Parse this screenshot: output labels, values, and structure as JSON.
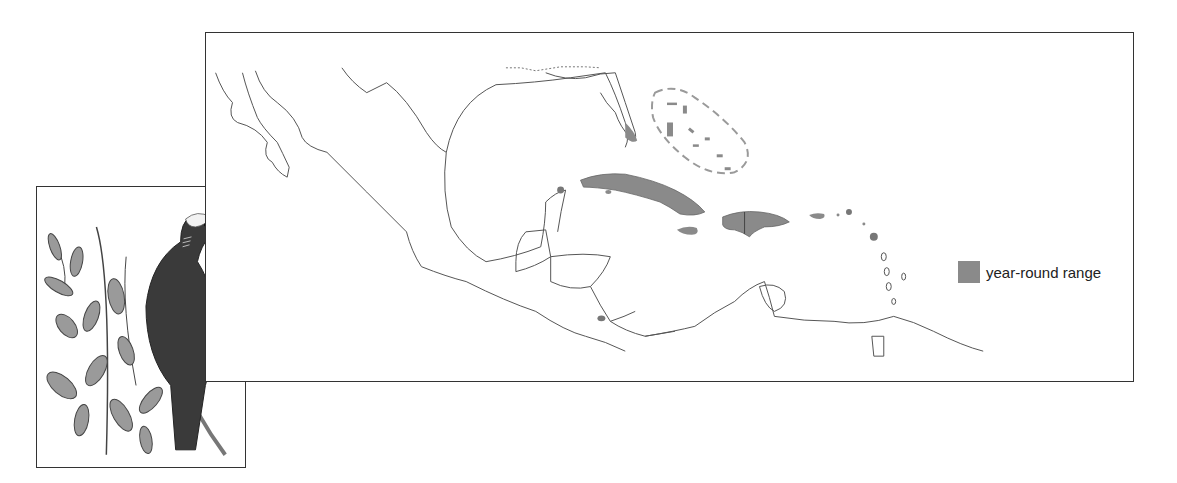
{
  "figure": {
    "type": "species range map",
    "legend": {
      "items": [
        {
          "label": "year-round range",
          "color": "#8a8a8a"
        }
      ]
    },
    "map": {
      "region": "Gulf of Mexico, Central America and Caribbean",
      "range_color": "#8a8a8a",
      "coastline_color": "#555555",
      "dashed_outline_color": "#9a9a9a"
    },
    "illustration": {
      "subject": "pigeon-with-white-crown-on-branch"
    }
  }
}
